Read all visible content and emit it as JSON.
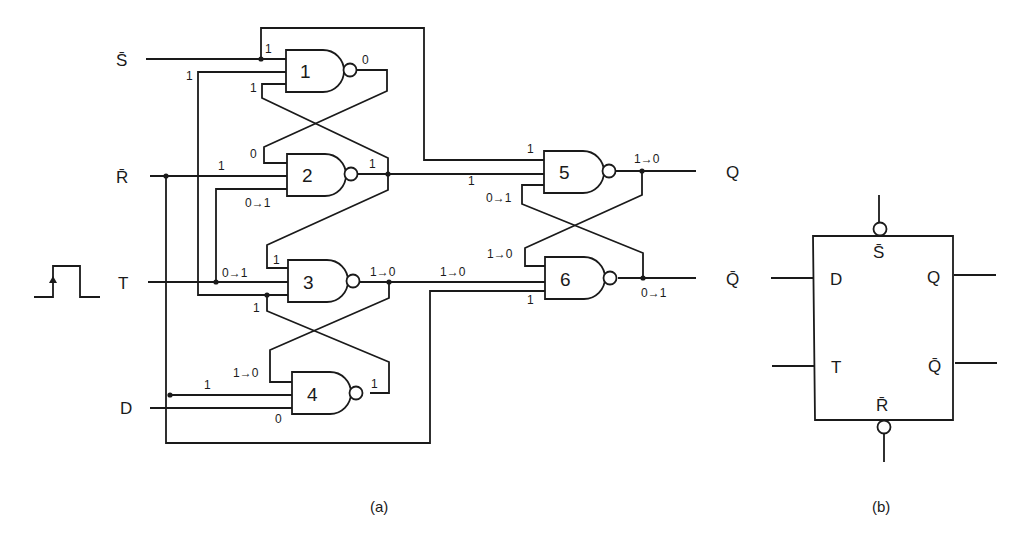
{
  "figure": {
    "part_a": {
      "caption": "(a)",
      "inputs": {
        "s_bar": "S̄",
        "r_bar": "R̄",
        "t": "T",
        "d": "D"
      },
      "outputs": {
        "q": "Q",
        "q_bar": "Q̄"
      },
      "clock_pulse_icon": "rising-edge-pulse",
      "gates": [
        {
          "id": "1",
          "type": "NAND",
          "inputs": [
            "1",
            "1",
            "1"
          ],
          "output": "0"
        },
        {
          "id": "2",
          "type": "NAND",
          "inputs": [
            "0",
            "1",
            "0→1"
          ],
          "output": "1"
        },
        {
          "id": "3",
          "type": "NAND",
          "inputs": [
            "1",
            "0→1",
            "1"
          ],
          "output": "1→0"
        },
        {
          "id": "4",
          "type": "NAND",
          "inputs": [
            "1→0",
            "1",
            "0"
          ],
          "output": "1"
        },
        {
          "id": "5",
          "type": "NAND",
          "inputs": [
            "1",
            "1",
            "0→1"
          ],
          "output": "1→0"
        },
        {
          "id": "6",
          "type": "NAND",
          "inputs": [
            "1→0",
            "1→0",
            "1"
          ],
          "output": "0→1"
        }
      ],
      "state_labels": {
        "g1_in_top": "1",
        "g1_in_mid": "1",
        "g1_in_bot": "1",
        "g1_out": "0",
        "g2_in_top": "0",
        "g2_in_mid": "1",
        "g2_in_bot": "0→1",
        "g2_out": "1",
        "g3_in_top": "1",
        "g3_in_mid": "0→1",
        "g3_in_bot": "1",
        "g3_out": "1→0",
        "g4_in_top": "1→0",
        "g4_in_mid": "1",
        "g4_in_bot": "0",
        "g4_out": "1",
        "g5_in_top": "1",
        "g5_in_mid": "1",
        "g5_in_bot": "0→1",
        "g5_out": "1→0",
        "g6_in_top": "1→0",
        "g6_in_mid": "1→0",
        "g6_in_bot": "1",
        "g6_out": "0→1"
      }
    },
    "part_b": {
      "caption": "(b)",
      "block_pins": {
        "top": "S̄",
        "bottom": "R̄",
        "left_top": "D",
        "left_bottom": "T",
        "right_top": "Q",
        "right_bottom": "Q̄"
      }
    }
  }
}
